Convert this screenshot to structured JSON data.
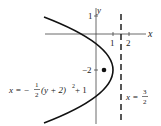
{
  "diagram": {
    "axes": {
      "x_label": "x",
      "y_label": "y",
      "x_ticks": [
        "1",
        "2"
      ],
      "y_ticks": [
        "1",
        "−2"
      ]
    },
    "parabola": {
      "equation_lhs": "x = −",
      "frac_num": "1",
      "frac_den": "2",
      "equation_rest": "(y + 2)",
      "exponent": "2",
      "equation_tail": " + 1",
      "vertex": [
        1,
        -2
      ],
      "opens": "left"
    },
    "focus": {
      "x": 0.5,
      "y": -2
    },
    "directrix": {
      "lhs": "x = ",
      "frac_num": "3",
      "frac_den": "2",
      "x": 1.5,
      "style": "dashed"
    }
  }
}
